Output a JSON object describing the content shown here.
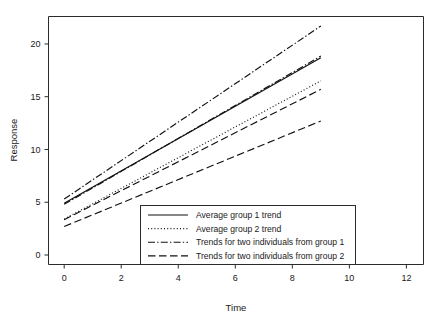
{
  "chart_data": {
    "type": "line",
    "title": "",
    "xlabel": "Time",
    "ylabel": "Response",
    "xlim": [
      -0.55,
      12.6
    ],
    "ylim": [
      -0.9,
      22.6
    ],
    "xticks": [
      0,
      2,
      4,
      6,
      8,
      10,
      12
    ],
    "xtick_labels": [
      "0",
      "2",
      "4",
      "6",
      "8",
      "10",
      "12"
    ],
    "yticks": [
      0,
      5,
      10,
      15,
      20
    ],
    "ytick_labels": [
      "0",
      "5",
      "10",
      "15",
      "20"
    ],
    "grid": false,
    "legend_position": "lower center",
    "x": [
      0,
      9
    ],
    "series": [
      {
        "name": "Average group 1 trend",
        "style": "solid",
        "values": [
          4.9,
          18.7
        ]
      },
      {
        "name": "Average group 2 trend",
        "style": "dotted",
        "values": [
          3.4,
          16.5
        ]
      },
      {
        "name": "Trends for two individuals from group 1 (upper)",
        "style": "dashdot",
        "values": [
          5.3,
          21.7
        ]
      },
      {
        "name": "Trends for two individuals from group 1 (lower)",
        "style": "dashdot",
        "values": [
          4.8,
          18.85
        ]
      },
      {
        "name": "Trends for two individuals from group 2 (upper)",
        "style": "dashed",
        "values": [
          3.35,
          15.7
        ]
      },
      {
        "name": "Trends for two individuals from group 2 (lower)",
        "style": "dashed",
        "values": [
          2.7,
          12.7
        ]
      }
    ],
    "legend_entries": [
      {
        "label": "Average group 1 trend",
        "style": "solid"
      },
      {
        "label": "Average group 2 trend",
        "style": "dotted"
      },
      {
        "label": "Trends for two individuals from group 1",
        "style": "dashdot"
      },
      {
        "label": "Trends for two individuals from group 2",
        "style": "dashed"
      }
    ]
  },
  "colors": {
    "ink": "#111111",
    "axis": "#2b2b2b",
    "background": "#ffffff"
  }
}
